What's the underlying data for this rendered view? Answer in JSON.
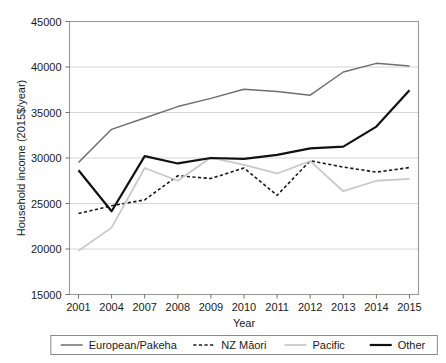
{
  "chart_data": {
    "type": "line",
    "title": "",
    "xlabel": "Year",
    "ylabel": "Household income (2015$/year)",
    "categories": [
      "2001",
      "2004",
      "2007",
      "2008",
      "2009",
      "2010",
      "2011",
      "2012",
      "2013",
      "2014",
      "2015"
    ],
    "x": [
      2001,
      2004,
      2007,
      2008,
      2009,
      2010,
      2011,
      2012,
      2013,
      2014,
      2015
    ],
    "ylim": [
      15000,
      45000
    ],
    "yticks": [
      15000,
      20000,
      25000,
      30000,
      35000,
      40000,
      45000
    ],
    "ytick_labels": [
      "15000",
      "20000",
      "25000",
      "30000",
      "35000",
      "40000",
      "45000"
    ],
    "grid": true,
    "legend_position": "bottom",
    "series": [
      {
        "name": "European/Pakeha",
        "style": "solid",
        "color": "#6e6e6e",
        "width": 1.5,
        "values": [
          29500,
          33150,
          34400,
          35650,
          36550,
          37550,
          37300,
          36900,
          39450,
          40400,
          40100
        ]
      },
      {
        "name": "NZ Māori",
        "style": "dashed",
        "color": "#1a1a1a",
        "width": 1.6,
        "values": [
          23900,
          24750,
          25400,
          28050,
          27750,
          28900,
          25900,
          29700,
          29000,
          28450,
          28950
        ]
      },
      {
        "name": "Pacific",
        "style": "solid",
        "color": "#c9c9c9",
        "width": 1.8,
        "values": [
          19800,
          22350,
          28900,
          27500,
          30050,
          29250,
          28300,
          29650,
          26350,
          27500,
          27700
        ]
      },
      {
        "name": "Other",
        "style": "solid",
        "color": "#111111",
        "width": 2.2,
        "values": [
          28650,
          24150,
          30200,
          29400,
          30000,
          29900,
          30350,
          31050,
          31250,
          33450,
          37450
        ]
      }
    ]
  },
  "axes": {
    "x_axis_title": "Year",
    "y_axis_title": "Household income (2015$/year)"
  },
  "legend": {
    "entries": [
      {
        "label": "European/Pakeha"
      },
      {
        "label": "NZ Māori"
      },
      {
        "label": "Pacific"
      },
      {
        "label": "Other"
      }
    ]
  }
}
